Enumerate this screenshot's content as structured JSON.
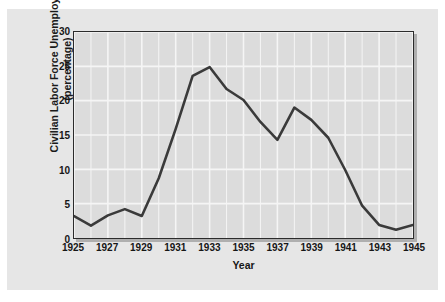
{
  "chart_data": {
    "type": "line",
    "title": "",
    "xlabel": "Year",
    "ylabel": "Civilian Labor Force Unemployed (percentage)",
    "ylabel_line1": "Civilian Labor Force Unemployed",
    "ylabel_line2": "(percentage)",
    "xlim": [
      1925,
      1945
    ],
    "ylim": [
      0,
      30
    ],
    "ytick_labels": [
      "0",
      "5",
      "10",
      "15",
      "20",
      "25",
      "30"
    ],
    "ytick_values": [
      0,
      5,
      10,
      15,
      20,
      25,
      30
    ],
    "xtick_labels": [
      "1925",
      "1927",
      "1929",
      "1931",
      "1933",
      "1935",
      "1937",
      "1939",
      "1941",
      "1943",
      "1945"
    ],
    "xtick_values": [
      1925,
      1927,
      1929,
      1931,
      1933,
      1935,
      1937,
      1939,
      1941,
      1943,
      1945
    ],
    "grid": true,
    "grid_color": "#f5f5f5",
    "plot_bg": "#dcdcdc",
    "figure_bg": "#e6e6e6",
    "line_color": "#3a3a3a",
    "legend": "none",
    "x": [
      1925,
      1926,
      1927,
      1928,
      1929,
      1930,
      1931,
      1932,
      1933,
      1934,
      1935,
      1936,
      1937,
      1938,
      1939,
      1940,
      1941,
      1942,
      1943,
      1944,
      1945
    ],
    "values": [
      3.2,
      1.8,
      3.3,
      4.2,
      3.2,
      8.7,
      15.9,
      23.6,
      24.9,
      21.7,
      20.1,
      16.9,
      14.3,
      19.0,
      17.2,
      14.6,
      9.9,
      4.7,
      1.9,
      1.2,
      1.9
    ],
    "series": [
      {
        "name": "Civilian Labor Force Unemployed",
        "values": [
          3.2,
          1.8,
          3.3,
          4.2,
          3.2,
          8.7,
          15.9,
          23.6,
          24.9,
          21.7,
          20.1,
          16.9,
          14.3,
          19.0,
          17.2,
          14.6,
          9.9,
          4.7,
          1.9,
          1.2,
          1.9
        ]
      }
    ]
  }
}
